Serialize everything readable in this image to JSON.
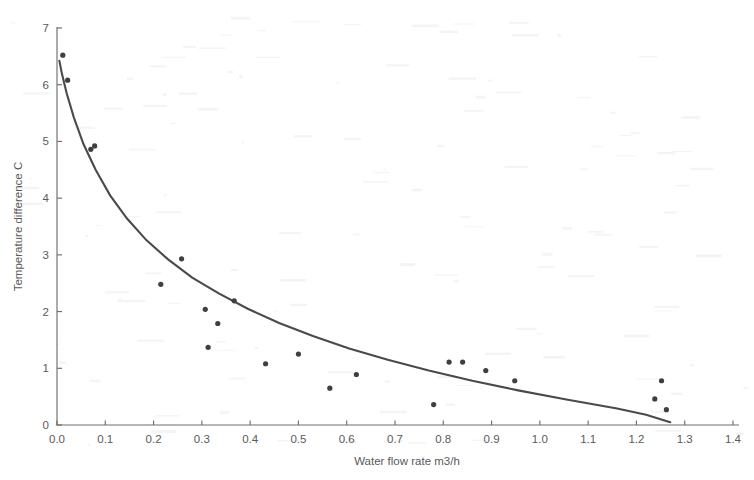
{
  "chart_data": {
    "type": "scatter",
    "title": "",
    "xlabel": "Water flow rate m3/h",
    "ylabel": "Temperature difference C",
    "xlim": [
      0.0,
      1.4
    ],
    "ylim": [
      0,
      7
    ],
    "grid": false,
    "legend": null,
    "xticks": [
      "0.0",
      "0.1",
      "0.2",
      "0.3",
      "0.4",
      "0.5",
      "0.6",
      "0.7",
      "0.8",
      "0.9",
      "1.0",
      "1.1",
      "1.2",
      "1.3",
      "1.4"
    ],
    "xtick_values": [
      0.0,
      0.1,
      0.2,
      0.3,
      0.4,
      0.5,
      0.6,
      0.7,
      0.8,
      0.9,
      1.0,
      1.1,
      1.2,
      1.3,
      1.4
    ],
    "yticks": [
      "0",
      "1",
      "2",
      "3",
      "4",
      "5",
      "6",
      "7"
    ],
    "ytick_values": [
      0,
      1,
      2,
      3,
      4,
      5,
      6,
      7
    ],
    "series": [
      {
        "name": "measured",
        "type": "scatter",
        "points": [
          [
            0.012,
            6.52
          ],
          [
            0.022,
            6.08
          ],
          [
            0.07,
            4.86
          ],
          [
            0.078,
            4.92
          ],
          [
            0.215,
            2.48
          ],
          [
            0.258,
            2.93
          ],
          [
            0.307,
            2.04
          ],
          [
            0.313,
            1.37
          ],
          [
            0.333,
            1.79
          ],
          [
            0.367,
            2.19
          ],
          [
            0.432,
            1.08
          ],
          [
            0.5,
            1.25
          ],
          [
            0.565,
            0.65
          ],
          [
            0.62,
            0.89
          ],
          [
            0.78,
            0.36
          ],
          [
            0.812,
            1.11
          ],
          [
            0.84,
            1.11
          ],
          [
            0.888,
            0.96
          ],
          [
            0.948,
            0.78
          ],
          [
            1.238,
            0.46
          ],
          [
            1.252,
            0.78
          ],
          [
            1.262,
            0.27
          ]
        ]
      },
      {
        "name": "fitted curve",
        "type": "line",
        "points": [
          [
            0.005,
            6.42
          ],
          [
            0.01,
            6.2
          ],
          [
            0.02,
            5.85
          ],
          [
            0.035,
            5.42
          ],
          [
            0.055,
            4.95
          ],
          [
            0.08,
            4.5
          ],
          [
            0.11,
            4.05
          ],
          [
            0.145,
            3.64
          ],
          [
            0.185,
            3.26
          ],
          [
            0.23,
            2.92
          ],
          [
            0.28,
            2.6
          ],
          [
            0.335,
            2.32
          ],
          [
            0.395,
            2.05
          ],
          [
            0.46,
            1.8
          ],
          [
            0.53,
            1.57
          ],
          [
            0.605,
            1.35
          ],
          [
            0.685,
            1.15
          ],
          [
            0.77,
            0.96
          ],
          [
            0.86,
            0.78
          ],
          [
            0.955,
            0.61
          ],
          [
            1.055,
            0.45
          ],
          [
            1.16,
            0.29
          ],
          [
            1.22,
            0.18
          ],
          [
            1.27,
            0.05
          ]
        ]
      }
    ]
  },
  "colors": {
    "point": "#3f3f3f",
    "curve": "#4a4a4a",
    "axis": "#6e6e6e",
    "text": "#5a5a5a",
    "background": "#ffffff"
  }
}
